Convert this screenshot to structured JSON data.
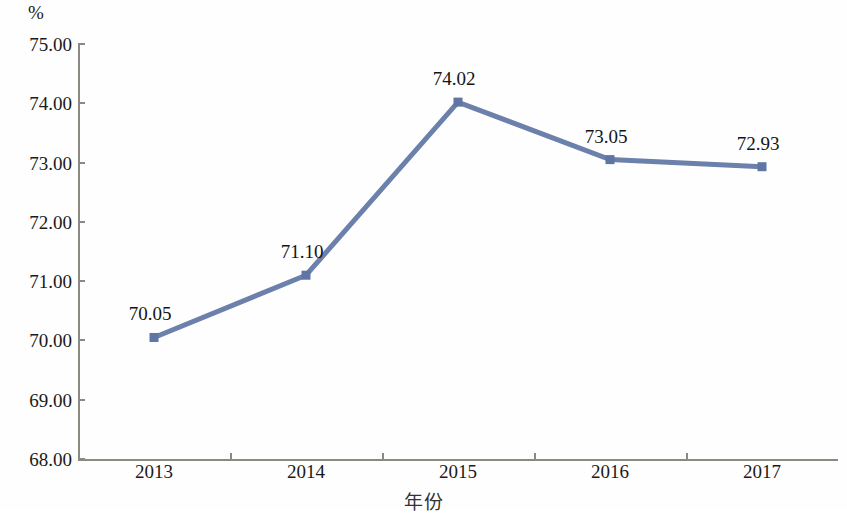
{
  "chart_data": {
    "type": "line",
    "title": "",
    "subtitle": "",
    "xlabel": "年份",
    "ylabel": "",
    "unit_label": "%",
    "categories": [
      "2013",
      "2014",
      "2015",
      "2016",
      "2017"
    ],
    "values": [
      70.05,
      71.1,
      74.02,
      73.05,
      72.93
    ],
    "data_labels": [
      "70.05",
      "71.10",
      "74.02",
      "73.05",
      "72.93"
    ],
    "series": [
      {
        "name": "",
        "values": [
          70.05,
          71.1,
          74.02,
          73.05,
          72.93
        ]
      }
    ],
    "ylim": [
      68.0,
      75.0
    ],
    "ystep": 1.0,
    "ytick_labels": [
      "75.00",
      "74.00",
      "73.00",
      "72.00",
      "71.00",
      "70.00",
      "69.00",
      "68.00"
    ],
    "ytick_values": [
      75.0,
      74.0,
      73.0,
      72.0,
      71.0,
      70.0,
      69.0,
      68.0
    ],
    "grid": false,
    "legend": false,
    "legend_position": "none",
    "marker": "square",
    "line_color": "#6b80ab",
    "marker_color": "#5f76a4",
    "axis_color": "#8a8a82",
    "text_color": "#1a1a1a",
    "background_color": "#fefefe"
  }
}
